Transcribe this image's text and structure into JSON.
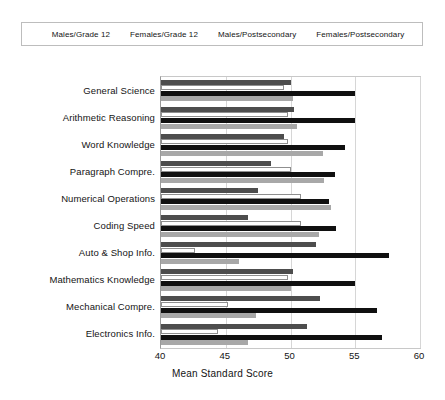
{
  "chart_data": {
    "type": "bar",
    "orientation": "horizontal",
    "title": "",
    "xlabel": "Mean Standard Score",
    "ylabel": "",
    "xlim": [
      40,
      60
    ],
    "xticks": [
      40,
      45,
      50,
      55,
      60
    ],
    "grid": true,
    "legend_position": "top",
    "categories": [
      "General Science",
      "Arithmetic Reasoning",
      "Word Knowledge",
      "Paragraph Compre.",
      "Numerical Operations",
      "Coding Speed",
      "Auto & Shop Info.",
      "Mathematics Knowledge",
      "Mechanical Compre.",
      "Electronics Info."
    ],
    "series": [
      {
        "name": "Males/Grade 12",
        "color": "#4d4d4d",
        "values": [
          50.0,
          50.3,
          49.5,
          48.5,
          47.5,
          46.7,
          52.0,
          50.2,
          52.3,
          51.3
        ]
      },
      {
        "name": "Females/Grade 12",
        "color": "#ffffff",
        "values": [
          49.5,
          49.8,
          49.8,
          50.0,
          50.8,
          50.8,
          42.6,
          49.8,
          45.2,
          44.4
        ]
      },
      {
        "name": "Males/Postsecondary",
        "color": "#101010",
        "values": [
          55.0,
          55.0,
          54.2,
          53.4,
          53.0,
          53.5,
          57.6,
          55.0,
          56.7,
          57.1
        ]
      },
      {
        "name": "Females/Postsecondary",
        "color": "#a8a8a8",
        "values": [
          50.2,
          50.5,
          52.5,
          52.6,
          53.1,
          52.2,
          46.0,
          50.0,
          47.3,
          46.7
        ]
      }
    ]
  },
  "legend": {
    "entries": [
      {
        "label": "Males/Grade 12",
        "swatch": "dark-gray"
      },
      {
        "label": "Females/Grade 12",
        "swatch": "white"
      },
      {
        "label": "Males/Postsecondary",
        "swatch": "black"
      },
      {
        "label": "Females/Postsecondary",
        "swatch": "light-gray"
      }
    ]
  }
}
